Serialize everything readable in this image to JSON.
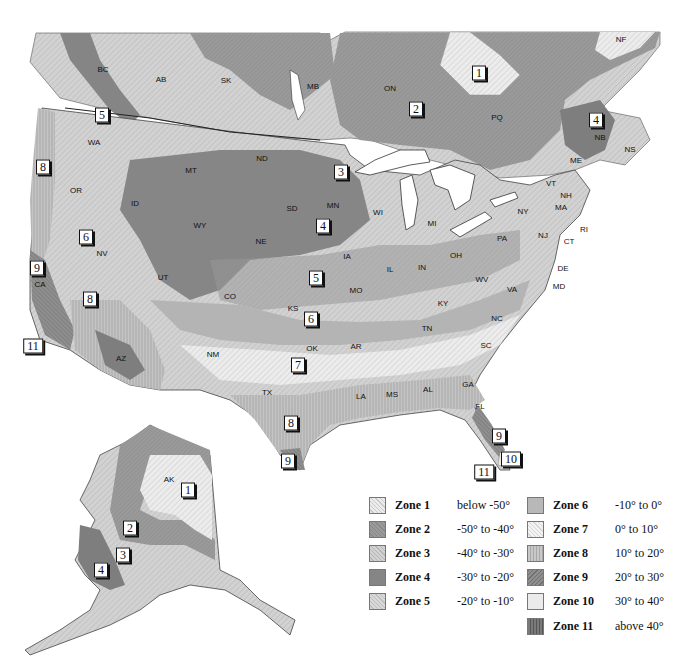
{
  "map": {
    "title": "USDA Plant Hardiness Zones — North America",
    "region_labels": [
      {
        "id": "BC",
        "text": "BC",
        "x": 103,
        "y": 69
      },
      {
        "id": "AB",
        "text": "AB",
        "x": 161,
        "y": 79
      },
      {
        "id": "SK",
        "text": "SK",
        "x": 226,
        "y": 80
      },
      {
        "id": "MB",
        "text": "MB",
        "x": 313,
        "y": 86
      },
      {
        "id": "ON",
        "text": "ON",
        "x": 390,
        "y": 88
      },
      {
        "id": "PQ",
        "text": "PQ",
        "x": 497,
        "y": 117
      },
      {
        "id": "NF",
        "text": "NF",
        "x": 621,
        "y": 39
      },
      {
        "id": "NB",
        "text": "NB",
        "x": 600,
        "y": 137
      },
      {
        "id": "NS",
        "text": "NS",
        "x": 630,
        "y": 149
      },
      {
        "id": "ME",
        "text": "ME",
        "x": 576,
        "y": 160
      },
      {
        "id": "VT",
        "text": "VT",
        "x": 551,
        "y": 183
      },
      {
        "id": "NH",
        "text": "NH",
        "x": 566,
        "y": 195
      },
      {
        "id": "MA",
        "text": "MA",
        "x": 561,
        "y": 207
      },
      {
        "id": "RI",
        "text": "RI",
        "x": 584,
        "y": 229
      },
      {
        "id": "CT",
        "text": "CT",
        "x": 569,
        "y": 241
      },
      {
        "id": "NY",
        "text": "NY",
        "x": 523,
        "y": 211
      },
      {
        "id": "NJ",
        "text": "NJ",
        "x": 543,
        "y": 235
      },
      {
        "id": "PA",
        "text": "PA",
        "x": 502,
        "y": 238
      },
      {
        "id": "DE",
        "text": "DE",
        "x": 563,
        "y": 268
      },
      {
        "id": "MD",
        "text": "MD",
        "x": 559,
        "y": 286
      },
      {
        "id": "WA",
        "text": "WA",
        "x": 94,
        "y": 142
      },
      {
        "id": "OR",
        "text": "OR",
        "x": 76,
        "y": 190
      },
      {
        "id": "ID",
        "text": "ID",
        "x": 135,
        "y": 203
      },
      {
        "id": "MT",
        "text": "MT",
        "x": 191,
        "y": 170
      },
      {
        "id": "WY",
        "text": "WY",
        "x": 200,
        "y": 225
      },
      {
        "id": "ND",
        "text": "ND",
        "x": 262,
        "y": 158
      },
      {
        "id": "SD",
        "text": "SD",
        "x": 292,
        "y": 208
      },
      {
        "id": "NE",
        "text": "NE",
        "x": 261,
        "y": 241
      },
      {
        "id": "MN",
        "text": "MN",
        "x": 333,
        "y": 205
      },
      {
        "id": "WI",
        "text": "WI",
        "x": 378,
        "y": 212
      },
      {
        "id": "MI",
        "text": "MI",
        "x": 432,
        "y": 223
      },
      {
        "id": "IA",
        "text": "IA",
        "x": 347,
        "y": 256
      },
      {
        "id": "IL",
        "text": "IL",
        "x": 390,
        "y": 269
      },
      {
        "id": "IN",
        "text": "IN",
        "x": 422,
        "y": 267
      },
      {
        "id": "OH",
        "text": "OH",
        "x": 456,
        "y": 255
      },
      {
        "id": "WV",
        "text": "WV",
        "x": 482,
        "y": 279
      },
      {
        "id": "VA",
        "text": "VA",
        "x": 512,
        "y": 289
      },
      {
        "id": "KY",
        "text": "KY",
        "x": 443,
        "y": 303
      },
      {
        "id": "NV",
        "text": "NV",
        "x": 102,
        "y": 253
      },
      {
        "id": "UT",
        "text": "UT",
        "x": 163,
        "y": 277
      },
      {
        "id": "CO",
        "text": "CO",
        "x": 230,
        "y": 296
      },
      {
        "id": "KS",
        "text": "KS",
        "x": 293,
        "y": 308
      },
      {
        "id": "MO",
        "text": "MO",
        "x": 356,
        "y": 290
      },
      {
        "id": "CA",
        "text": "CA",
        "x": 40,
        "y": 284
      },
      {
        "id": "AZ",
        "text": "AZ",
        "x": 121,
        "y": 358
      },
      {
        "id": "NM",
        "text": "NM",
        "x": 213,
        "y": 354
      },
      {
        "id": "OK",
        "text": "OK",
        "x": 312,
        "y": 348
      },
      {
        "id": "AR",
        "text": "AR",
        "x": 356,
        "y": 346
      },
      {
        "id": "TN",
        "text": "TN",
        "x": 427,
        "y": 328
      },
      {
        "id": "NC",
        "text": "NC",
        "x": 497,
        "y": 318
      },
      {
        "id": "SC",
        "text": "SC",
        "x": 486,
        "y": 345
      },
      {
        "id": "TX",
        "text": "TX",
        "x": 267,
        "y": 392
      },
      {
        "id": "LA",
        "text": "LA",
        "x": 361,
        "y": 396
      },
      {
        "id": "MS",
        "text": "MS",
        "x": 392,
        "y": 394
      },
      {
        "id": "AL",
        "text": "AL",
        "x": 428,
        "y": 389
      },
      {
        "id": "GA",
        "text": "GA",
        "x": 468,
        "y": 384
      },
      {
        "id": "FL",
        "text": "FL",
        "x": 480,
        "y": 406
      },
      {
        "id": "AK",
        "text": "AK",
        "x": 169,
        "y": 479
      }
    ],
    "zone_markers": [
      {
        "text": "1",
        "x": 479,
        "y": 73
      },
      {
        "text": "2",
        "x": 416,
        "y": 109
      },
      {
        "text": "4",
        "x": 596,
        "y": 120
      },
      {
        "text": "5",
        "x": 102,
        "y": 115
      },
      {
        "text": "3",
        "x": 341,
        "y": 172
      },
      {
        "text": "8",
        "x": 43,
        "y": 167
      },
      {
        "text": "4",
        "x": 323,
        "y": 226
      },
      {
        "text": "6",
        "x": 86,
        "y": 237
      },
      {
        "text": "9",
        "x": 37,
        "y": 268
      },
      {
        "text": "5",
        "x": 316,
        "y": 278
      },
      {
        "text": "8",
        "x": 90,
        "y": 299
      },
      {
        "text": "6",
        "x": 311,
        "y": 319
      },
      {
        "text": "11",
        "x": 33,
        "y": 346
      },
      {
        "text": "7",
        "x": 298,
        "y": 365
      },
      {
        "text": "8",
        "x": 291,
        "y": 423
      },
      {
        "text": "9",
        "x": 288,
        "y": 461
      },
      {
        "text": "9",
        "x": 499,
        "y": 436
      },
      {
        "text": "10",
        "x": 511,
        "y": 459
      },
      {
        "text": "11",
        "x": 484,
        "y": 472
      },
      {
        "text": "1",
        "x": 188,
        "y": 490
      },
      {
        "text": "2",
        "x": 130,
        "y": 528
      },
      {
        "text": "3",
        "x": 123,
        "y": 555
      },
      {
        "text": "4",
        "x": 101,
        "y": 570
      }
    ]
  },
  "legend": {
    "items": [
      {
        "zone": "Zone 1",
        "range": "below -50°",
        "col": 0,
        "row": 0,
        "fill": "#e6e6e6",
        "pattern": "diag-light"
      },
      {
        "zone": "Zone 2",
        "range": "-50° to -40°",
        "col": 0,
        "row": 1,
        "fill": "#9a9a9a",
        "pattern": "cross"
      },
      {
        "zone": "Zone 3",
        "range": "-40° to -30°",
        "col": 0,
        "row": 2,
        "fill": "#d2d2d2",
        "pattern": "diag"
      },
      {
        "zone": "Zone 4",
        "range": "-30° to -20°",
        "col": 0,
        "row": 3,
        "fill": "#858585",
        "pattern": "solid"
      },
      {
        "zone": "Zone 5",
        "range": "-20° to -10°",
        "col": 0,
        "row": 4,
        "fill": "#cfcfcf",
        "pattern": "cross-light"
      },
      {
        "zone": "Zone 6",
        "range": "-10° to 0°",
        "col": 1,
        "row": 0,
        "fill": "#b8b8b8",
        "pattern": "solid"
      },
      {
        "zone": "Zone 7",
        "range": "0° to 10°",
        "col": 1,
        "row": 1,
        "fill": "#f0f0f0",
        "pattern": "diag-light"
      },
      {
        "zone": "Zone 8",
        "range": "10° to 20°",
        "col": 1,
        "row": 2,
        "fill": "#c4c4c4",
        "pattern": "vertical"
      },
      {
        "zone": "Zone 9",
        "range": "20° to 30°",
        "col": 1,
        "row": 3,
        "fill": "#8f8f8f",
        "pattern": "diag-dark"
      },
      {
        "zone": "Zone 10",
        "range": "30° to 40°",
        "col": 1,
        "row": 4,
        "fill": "#ebebeb",
        "pattern": "solid"
      },
      {
        "zone": "Zone 11",
        "range": "above 40°",
        "col": 1,
        "row": 5,
        "fill": "#7a7a7a",
        "pattern": "vertical-dark"
      }
    ]
  }
}
